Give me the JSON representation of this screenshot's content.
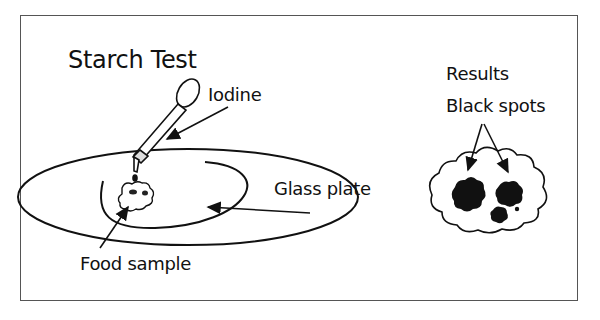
{
  "diagram": {
    "title": "Starch Test",
    "labels": {
      "iodine": "Iodine",
      "glass_plate": "Glass plate",
      "food_sample": "Food sample"
    },
    "results": {
      "heading": "Results",
      "spots_label": "Black spots"
    },
    "colors": {
      "ink": "#111111",
      "frame": "#555555",
      "background": "#ffffff"
    }
  }
}
